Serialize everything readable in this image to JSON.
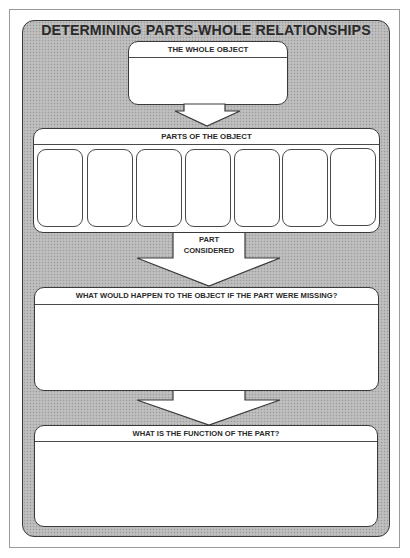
{
  "title": "DETERMINING PARTS-WHOLE RELATIONSHIPS",
  "whole_object": {
    "label": "THE WHOLE OBJECT",
    "value": ""
  },
  "parts": {
    "label": "PARTS OF THE OBJECT",
    "slots": [
      "",
      "",
      "",
      "",
      "",
      "",
      ""
    ]
  },
  "part_considered": {
    "line1": "PART",
    "line2": "CONSIDERED"
  },
  "missing": {
    "label": "WHAT WOULD HAPPEN TO THE OBJECT IF THE PART WERE MISSING?",
    "value": ""
  },
  "function": {
    "label": "WHAT IS THE FUNCTION OF THE PART?",
    "value": ""
  },
  "colors": {
    "frame_texture": "#b8b8b8",
    "outline": "#3a3a3a",
    "box_fill": "#ffffff"
  }
}
